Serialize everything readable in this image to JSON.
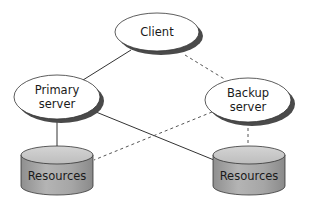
{
  "diagram": {
    "nodes": [
      {
        "id": "client",
        "label_lines": [
          "Client"
        ],
        "shape": "ellipse"
      },
      {
        "id": "primary",
        "label_lines": [
          "Primary",
          "server"
        ],
        "shape": "ellipse"
      },
      {
        "id": "backup",
        "label_lines": [
          "Backup",
          "server"
        ],
        "shape": "ellipse"
      },
      {
        "id": "resources_left",
        "label_lines": [
          "Resources"
        ],
        "shape": "cylinder"
      },
      {
        "id": "resources_right",
        "label_lines": [
          "Resources"
        ],
        "shape": "cylinder"
      }
    ],
    "edges": [
      {
        "from": "client",
        "to": "primary",
        "style": "solid"
      },
      {
        "from": "client",
        "to": "backup",
        "style": "dashed"
      },
      {
        "from": "primary",
        "to": "resources_left",
        "style": "solid"
      },
      {
        "from": "primary",
        "to": "resources_right",
        "style": "solid"
      },
      {
        "from": "backup",
        "to": "resources_left",
        "style": "dashed"
      },
      {
        "from": "backup",
        "to": "resources_right",
        "style": "dashed"
      }
    ],
    "colors": {
      "line": "#333333",
      "ellipse_fill": "#ffffff",
      "ellipse_shadow": "#555555",
      "cylinder_top": "#c8c8c8",
      "cylinder_body": "#a8a8a8"
    }
  }
}
